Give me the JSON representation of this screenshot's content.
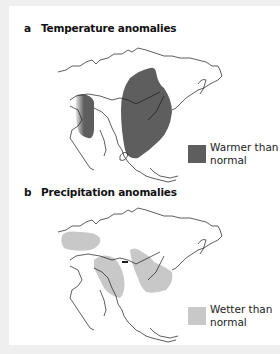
{
  "panels": [
    {
      "letter": "a",
      "title": "Temperature anomalies",
      "legend_label_line1": "Warmer than",
      "legend_label_line2": "normal",
      "legend_color": "#5e5e5e"
    },
    {
      "letter": "b",
      "title": "Precipitation anomalies",
      "legend_label_line1": "Wetter than",
      "legend_label_line2": "normal",
      "legend_color": "#c8c8c8"
    }
  ],
  "colors": {
    "background": "#efefef",
    "panel": "#ffffff",
    "outline": "#1a1a1a",
    "warm": "#5e5e5e",
    "wet": "#c8c8c8"
  }
}
